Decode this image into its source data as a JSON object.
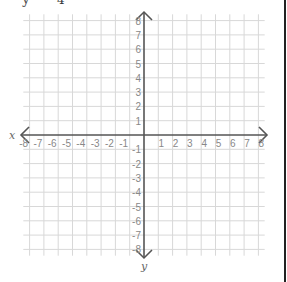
{
  "header": {
    "equation_fragment_var": "y",
    "equation_fragment_denominator": "4"
  },
  "graph": {
    "x_axis_label": "x",
    "y_axis_label": "y",
    "x_range": [
      -8,
      8
    ],
    "y_range": [
      -8,
      8
    ],
    "x_tick_labels": [
      "-8",
      "-7",
      "-6",
      "-5",
      "-4",
      "-3",
      "-2",
      "-1",
      "1",
      "2",
      "3",
      "4",
      "5",
      "6",
      "7",
      "8"
    ],
    "y_tick_labels": [
      "8",
      "7",
      "6",
      "5",
      "4",
      "3",
      "2",
      "1",
      "-1",
      "-2",
      "-3",
      "-4",
      "-5",
      "-6",
      "-7",
      "-8"
    ],
    "grid_color": "#d8d8d8",
    "axis_color": "#555555",
    "label_color": "#888888"
  }
}
